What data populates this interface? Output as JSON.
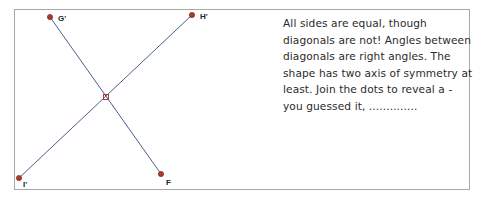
{
  "diagram": {
    "points": [
      {
        "id": "G",
        "label": "G'",
        "x": 50,
        "y": 17,
        "lx": 58,
        "ly": 21
      },
      {
        "id": "H",
        "label": "H'",
        "x": 192,
        "y": 15,
        "lx": 200,
        "ly": 19
      },
      {
        "id": "I",
        "label": "I'",
        "x": 19,
        "y": 178,
        "lx": 23,
        "ly": 187
      },
      {
        "id": "F",
        "label": "F",
        "x": 161,
        "y": 174,
        "lx": 166,
        "ly": 185
      },
      {
        "id": "C",
        "label": "",
        "x": 106,
        "y": 97
      }
    ],
    "segments": [
      [
        "G",
        "F"
      ],
      [
        "H",
        "I"
      ]
    ],
    "colors": {
      "line": "#4a5f8e",
      "point": "#b0392a",
      "point_outline": "#5a1a12"
    }
  },
  "description": {
    "text": "All sides are equal, though diagonals are not! Angles between diagonals are right angles. The shape has two axis of symmetry at least. Join the dots to reveal a - you guessed it, .............."
  }
}
